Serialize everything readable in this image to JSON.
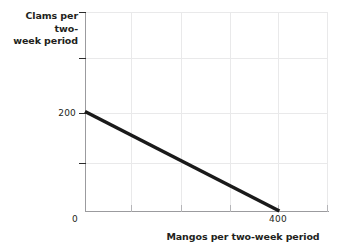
{
  "chart_data": {
    "type": "line",
    "title": "",
    "xlabel": "Mangos per two-week period",
    "ylabel": "Clams per two-week period",
    "ylabel_line1": "Clams per two-",
    "ylabel_line2": "week period",
    "xlim": [
      0,
      500
    ],
    "ylim": [
      0,
      400
    ],
    "grid": true,
    "legend": "none",
    "x_tick_labels": [
      "0",
      "",
      "",
      "",
      "400",
      ""
    ],
    "x_tick_values": [
      0,
      100,
      200,
      300,
      400,
      500
    ],
    "y_tick_labels": [
      "",
      "",
      "200",
      "",
      ""
    ],
    "y_tick_values": [
      400,
      300,
      200,
      100,
      0
    ],
    "series": [
      {
        "name": "budget-line",
        "color": "#1a1a1a",
        "x": [
          0,
          400
        ],
        "y": [
          200,
          0
        ]
      }
    ]
  },
  "axes": {
    "y_visible_tick_label": "200",
    "x_visible_tick_label_origin": "0",
    "x_visible_tick_label_max": "400"
  }
}
